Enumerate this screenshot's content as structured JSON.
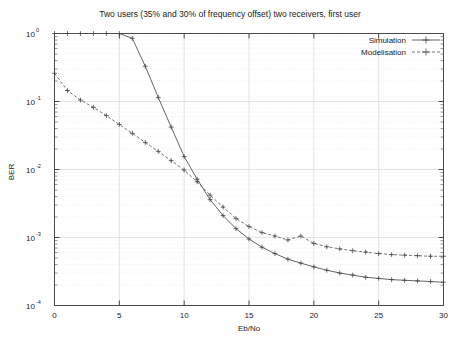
{
  "chart_data": {
    "type": "line",
    "title": "Two users (35% and 30% of frequency offset) two receivers, first user",
    "xlabel": "Eb/No",
    "ylabel": "BER",
    "xlim": [
      0,
      30
    ],
    "ylim": [
      0.0001,
      1
    ],
    "yscale": "log",
    "grid": true,
    "legend_position": "top-right",
    "xticks": [
      "0",
      "5",
      "10",
      "15",
      "20",
      "25",
      "30"
    ],
    "xtick_values": [
      0,
      5,
      10,
      15,
      20,
      25,
      30
    ],
    "yticks": [
      "10^0",
      "10^-1",
      "10^-2",
      "10^-3",
      "10^-4"
    ],
    "ytick_values": [
      1,
      0.1,
      0.01,
      0.001,
      0.0001
    ],
    "ytick_base": "10",
    "ytick_exponents": [
      "0",
      "-1",
      "-2",
      "-3",
      "-4"
    ],
    "series": [
      {
        "name": "Simulation",
        "style": "solid-with-cross",
        "x": [
          0,
          1,
          2,
          3,
          4,
          5,
          6,
          7,
          8,
          9,
          10,
          11,
          12,
          13,
          14,
          15,
          16,
          17,
          18,
          19,
          20,
          21,
          22,
          23,
          24,
          25,
          26,
          27,
          28,
          29,
          30
        ],
        "values": [
          1.0,
          1.0,
          1.0,
          1.0,
          1.0,
          1.0,
          0.85,
          0.33,
          0.115,
          0.042,
          0.0155,
          0.0072,
          0.0036,
          0.0021,
          0.00135,
          0.00095,
          0.00072,
          0.00058,
          0.00048,
          0.00042,
          0.00037,
          0.00033,
          0.0003,
          0.00028,
          0.00026,
          0.00025,
          0.00024,
          0.000235,
          0.00023,
          0.000225,
          0.00022
        ]
      },
      {
        "name": "Modelisation",
        "style": "dashed-with-cross",
        "x": [
          0,
          1,
          2,
          3,
          4,
          5,
          6,
          7,
          8,
          9,
          10,
          11,
          12,
          13,
          14,
          15,
          16,
          17,
          18,
          19,
          20,
          21,
          22,
          23,
          24,
          25,
          26,
          27,
          28,
          29,
          30
        ],
        "values": [
          0.26,
          0.145,
          0.105,
          0.082,
          0.062,
          0.046,
          0.034,
          0.025,
          0.0185,
          0.0135,
          0.0098,
          0.0066,
          0.0042,
          0.0028,
          0.0019,
          0.00145,
          0.00118,
          0.00105,
          0.00092,
          0.00105,
          0.00082,
          0.00073,
          0.00068,
          0.00064,
          0.00061,
          0.00058,
          0.00056,
          0.00055,
          0.00054,
          0.00053,
          0.00053
        ]
      }
    ]
  },
  "legend": {
    "entries": [
      {
        "label": "Simulation"
      },
      {
        "label": "Modelisation"
      }
    ]
  }
}
